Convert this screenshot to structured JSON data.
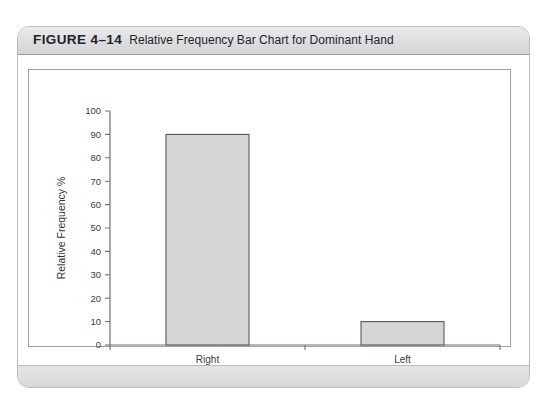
{
  "figure": {
    "number": "FIGURE 4–14",
    "caption": "Relative Frequency Bar Chart for Dominant Hand"
  },
  "chart_data": {
    "type": "bar",
    "title": "Relative Frequency Bar Chart for Dominant Hand",
    "categories": [
      "Right",
      "Left"
    ],
    "values": [
      90,
      10
    ],
    "xlabel": "Dominant Hand",
    "ylabel": "Relative Frequency %",
    "ylim": [
      0,
      100
    ],
    "ytick_labels": [
      "0",
      "10",
      "20",
      "30",
      "40",
      "50",
      "60",
      "70",
      "80",
      "90",
      "100"
    ],
    "ytick_values": [
      0,
      10,
      20,
      30,
      40,
      50,
      60,
      70,
      80,
      90,
      100
    ],
    "grid": false,
    "legend": null,
    "bar_fill_color": "#d4d5d6",
    "bar_edge_color": "#58595b",
    "axis_color": "#6e7173"
  }
}
